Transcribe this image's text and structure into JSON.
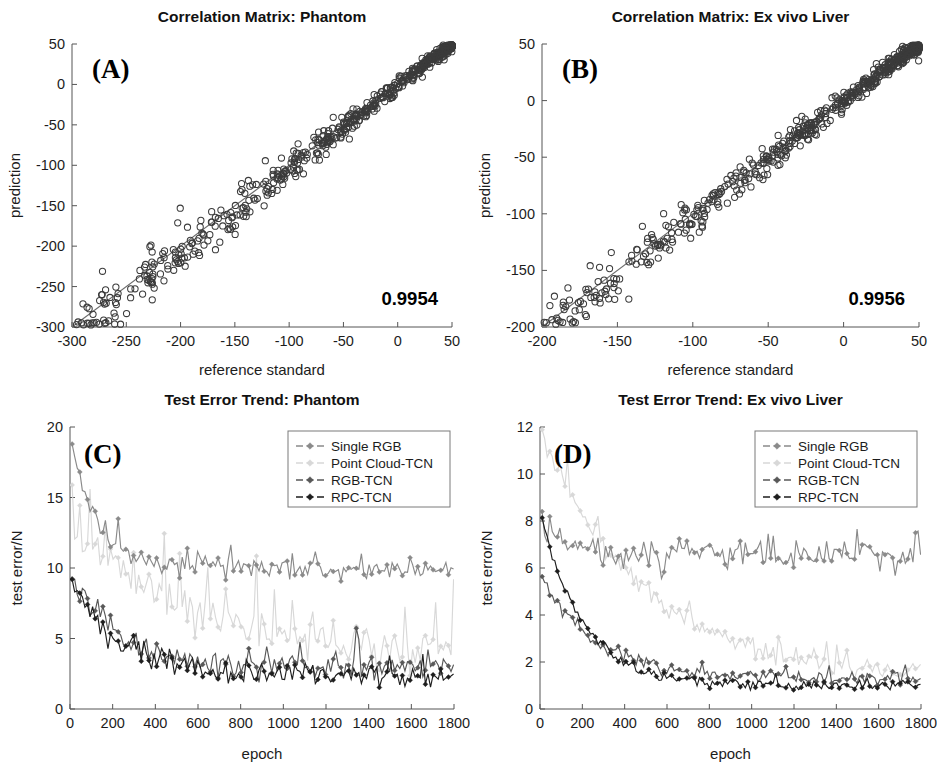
{
  "figure": {
    "layout": "2x2 panel scientific figure",
    "background_color": "#ffffff"
  },
  "series_styles": {
    "single_rgb": "#8a8a8a",
    "point_cloud_tcn": "#d8d8d8",
    "rgb_tcn": "#585858",
    "rpc_tcn": "#1e1e1e",
    "scatter_marker": "#3b3b3b",
    "identity_line": "#6d6d6d"
  },
  "panels": {
    "A": {
      "tag": "(A)",
      "title": "Correlation Matrix: Phantom",
      "annotation": "0.9954"
    },
    "B": {
      "tag": "(B)",
      "title": "Correlation Matrix: Ex vivo Liver",
      "annotation": "0.9956"
    },
    "C": {
      "tag": "(C)",
      "title": "Test Error Trend: Phantom"
    },
    "D": {
      "tag": "(D)",
      "title": "Test Error Trend: Ex vivo Liver"
    }
  },
  "chart_data": [
    {
      "id": "panel-a",
      "type": "scatter",
      "title": "Correlation Matrix: Phantom",
      "panel_label": "(A)",
      "xlabel": "reference standard",
      "ylabel": "prediction",
      "xlim": [
        -300,
        50
      ],
      "ylim": [
        -300,
        50
      ],
      "xticks": [
        -300,
        -250,
        -200,
        -150,
        -100,
        -50,
        0,
        50
      ],
      "xticklabels": [
        "-300",
        "-250",
        "-200",
        "-150",
        "-100",
        "-50",
        "0",
        "50"
      ],
      "yticks": [
        -300,
        -250,
        -200,
        -150,
        -100,
        -50,
        0,
        50
      ],
      "yticklabels": [
        "-300",
        "-250",
        "-200",
        "-150",
        "-100",
        "-50",
        "0",
        "50"
      ],
      "grid": false,
      "legend": "none",
      "annotations": [
        {
          "text": "0.9954",
          "position": "bottom-right",
          "meaning": "correlation coefficient"
        }
      ],
      "reference_line": {
        "type": "identity",
        "from": [
          -300,
          -300
        ],
        "to": [
          50,
          50
        ]
      },
      "marker": {
        "shape": "circle",
        "filled": false,
        "size": 3.1,
        "color": "#3b3b3b"
      },
      "n_points": 620,
      "scatter_model": {
        "description": "points lie along y=x with density increasing toward upper-right; spread widens and skews below the line at low values",
        "x_distribution": "beta-like, concentrated near -40..10",
        "residual_sigma_at_high_x": 4,
        "residual_sigma_at_low_x": 22,
        "residual_bias_at_low_x": -14
      }
    },
    {
      "id": "panel-b",
      "type": "scatter",
      "title": "Correlation Matrix: Ex vivo Liver",
      "panel_label": "(B)",
      "xlabel": "reference standard",
      "ylabel": "prediction",
      "xlim": [
        -200,
        50
      ],
      "ylim": [
        -200,
        50
      ],
      "xticks": [
        -200,
        -150,
        -100,
        -50,
        0,
        50
      ],
      "xticklabels": [
        "-200",
        "-150",
        "-100",
        "-50",
        "0",
        "50"
      ],
      "yticks": [
        -200,
        -150,
        -100,
        -50,
        0,
        50
      ],
      "yticklabels": [
        "-200",
        "-150",
        "-100",
        "-50",
        "0",
        "50"
      ],
      "grid": false,
      "legend": "none",
      "annotations": [
        {
          "text": "0.9956",
          "position": "bottom-right",
          "meaning": "correlation coefficient"
        }
      ],
      "reference_line": {
        "type": "identity",
        "from": [
          -200,
          -200
        ],
        "to": [
          50,
          50
        ]
      },
      "marker": {
        "shape": "circle",
        "filled": false,
        "size": 3.1,
        "color": "#3b3b3b"
      },
      "n_points": 640,
      "scatter_model": {
        "description": "tight band along y=x, densest between -60 and 35, a few low outliers below the line near -110",
        "x_distribution": "concentrated near -40..35",
        "residual_sigma_at_high_x": 3.4,
        "residual_sigma_at_low_x": 13,
        "residual_bias_at_low_x": -6
      }
    },
    {
      "id": "panel-c",
      "type": "line",
      "title": "Test Error Trend: Phantom",
      "panel_label": "(C)",
      "xlabel": "epoch",
      "ylabel": "test error/N",
      "xlim": [
        0,
        1800
      ],
      "ylim": [
        0,
        20
      ],
      "xticks": [
        0,
        200,
        400,
        600,
        800,
        1000,
        1200,
        1400,
        1600,
        1800
      ],
      "xticklabels": [
        "0",
        "200",
        "400",
        "600",
        "800",
        "1000",
        "1200",
        "1400",
        "1600",
        "1800"
      ],
      "yticks": [
        0,
        5,
        10,
        15,
        20
      ],
      "yticklabels": [
        "0",
        "5",
        "10",
        "15",
        "20"
      ],
      "grid": false,
      "legend_position": "top-right",
      "marker": {
        "shape": "diamond",
        "filled": true
      },
      "series": [
        {
          "name": "Single RGB",
          "color": "#8a8a8a",
          "start_value": 19.3,
          "plateau_value": 9.9,
          "decay_epochs": 130,
          "noise": 0.35,
          "spike_rate": 0.09,
          "spike_height": 1.7
        },
        {
          "name": "Point Cloud-TCN",
          "color": "#d8d8d8",
          "start_value": 12.6,
          "plateau_value": 3.4,
          "decay_epochs": 620,
          "noise": 0.75,
          "spike_rate": 0.16,
          "spike_height": 5.5
        },
        {
          "name": "RGB-TCN",
          "color": "#585858",
          "start_value": 9.4,
          "plateau_value": 3.0,
          "decay_epochs": 230,
          "noise": 0.5,
          "spike_rate": 0.1,
          "spike_height": 1.9
        },
        {
          "name": "RPC-TCN",
          "color": "#1e1e1e",
          "start_value": 9.5,
          "plateau_value": 2.4,
          "decay_epochs": 210,
          "noise": 0.45,
          "spike_rate": 0.07,
          "spike_height": 1.4
        }
      ]
    },
    {
      "id": "panel-d",
      "type": "line",
      "title": "Test Error Trend: Ex vivo Liver",
      "panel_label": "(D)",
      "xlabel": "epoch",
      "ylabel": "test error/N",
      "xlim": [
        0,
        1800
      ],
      "ylim": [
        0,
        12
      ],
      "xticks": [
        0,
        200,
        400,
        600,
        800,
        1000,
        1200,
        1400,
        1600,
        1800
      ],
      "xticklabels": [
        "0",
        "200",
        "400",
        "600",
        "800",
        "1000",
        "1200",
        "1400",
        "1600",
        "1800"
      ],
      "yticks": [
        0,
        2,
        4,
        6,
        8,
        10,
        12
      ],
      "yticklabels": [
        "0",
        "2",
        "4",
        "6",
        "8",
        "10",
        "12"
      ],
      "grid": false,
      "legend_position": "top-right",
      "marker": {
        "shape": "diamond",
        "filled": true
      },
      "series": [
        {
          "name": "Single RGB",
          "color": "#8a8a8a",
          "start_value": 8.4,
          "plateau_value": 6.5,
          "decay_epochs": 90,
          "noise": 0.3,
          "spike_rate": 0.12,
          "spike_height": 1.3
        },
        {
          "name": "Point Cloud-TCN",
          "color": "#d8d8d8",
          "start_value": 11.9,
          "plateau_value": 1.3,
          "decay_epochs": 480,
          "noise": 0.22,
          "spike_rate": 0.1,
          "spike_height": 1.0
        },
        {
          "name": "RGB-TCN",
          "color": "#585858",
          "start_value": 5.8,
          "plateau_value": 1.3,
          "decay_epochs": 250,
          "noise": 0.14,
          "spike_rate": 0.06,
          "spike_height": 0.5
        },
        {
          "name": "RPC-TCN",
          "color": "#1e1e1e",
          "start_value": 8.4,
          "plateau_value": 1.0,
          "decay_epochs": 200,
          "noise": 0.12,
          "spike_rate": 0.05,
          "spike_height": 0.4
        }
      ]
    }
  ],
  "legend_entries": [
    "Single RGB",
    "Point Cloud-TCN",
    "RGB-TCN",
    "RPC-TCN"
  ]
}
